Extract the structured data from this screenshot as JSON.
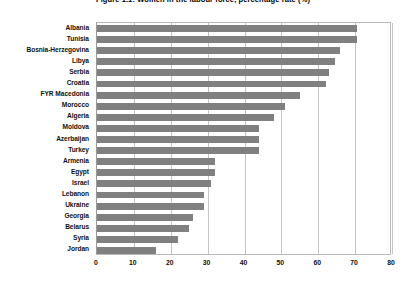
{
  "chart_data": {
    "type": "bar",
    "orientation": "horizontal",
    "title": "Figure 1.1: Women in the labour force, percentage rate (%)",
    "xlabel": "",
    "ylabel": "",
    "xlim": [
      0,
      80
    ],
    "xticks": [
      0,
      10,
      20,
      30,
      40,
      50,
      60,
      70,
      80
    ],
    "xtick_labels": [
      "0",
      "10",
      "20",
      "30",
      "40",
      "50",
      "60",
      "70",
      "80"
    ],
    "grid": true,
    "legend": false,
    "series_color": "#808080",
    "categories": [
      "Albania",
      "Tunisia",
      "Bosnia-Herzegovina",
      "Libya",
      "Serbia",
      "Croatia",
      "FYR Macedonia",
      "Morocco",
      "Algeria",
      "Moldova",
      "Azerbaijan",
      "Turkey",
      "Armenia",
      "Egypt",
      "Israel",
      "Lebanon",
      "Ukraine",
      "Georgia",
      "Belarus",
      "Syria",
      "Jordan"
    ],
    "values": [
      70.5,
      70.5,
      66,
      64.5,
      63,
      62,
      55,
      51,
      48,
      44,
      44,
      44,
      32,
      32,
      31,
      29,
      29,
      26,
      25,
      22,
      16
    ]
  }
}
